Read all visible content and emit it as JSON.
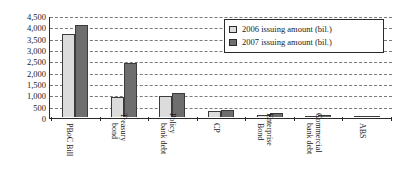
{
  "chart_data": {
    "type": "bar",
    "title": "",
    "xlabel": "",
    "ylabel": "",
    "ylim": [
      0,
      4500
    ],
    "ytick_step": 500,
    "grid": true,
    "legend_position": "top-right",
    "categories": [
      "PBoC Bill",
      "Treasury bond",
      "Policy bank debt",
      "CP",
      "Enterprise Bond",
      "Commercial bank debt",
      "ABS"
    ],
    "category_lines": [
      [
        "PBoC Bill"
      ],
      [
        "Treasury",
        "bond"
      ],
      [
        "Policy",
        "bank debt"
      ],
      [
        "CP"
      ],
      [
        "Enterprise",
        "Bond"
      ],
      [
        "Commercial",
        "bank debt"
      ],
      [
        "ABS"
      ]
    ],
    "ytick_labels": [
      "4,500",
      "4,000",
      "3,500",
      "3,000",
      "2,500",
      "2,000",
      "1,500",
      "1,000",
      "500",
      "0"
    ],
    "ytick_values": [
      4500,
      4000,
      3500,
      3000,
      2500,
      2000,
      1500,
      1000,
      500,
      0
    ],
    "series": [
      {
        "name": "2006 issuing amount (bil.)",
        "color": "#dcdcdc",
        "values": [
          3650,
          870,
          920,
          280,
          100,
          60,
          10
        ]
      },
      {
        "name": "2007 issuing amount (bil.)",
        "color": "#6e6e6e",
        "values": [
          4050,
          2370,
          1080,
          330,
          170,
          110,
          20
        ]
      }
    ]
  },
  "legend": {
    "items": [
      {
        "label": "2006 issuing amount (bil.)",
        "swatch": "light-gray-swatch"
      },
      {
        "label": "2007 issuing amount (bil.)",
        "swatch": "dark-gray-swatch"
      }
    ]
  },
  "colors": {
    "series_2006": "#dcdcdc",
    "series_2007": "#6e6e6e",
    "axis": "#2b2b2b",
    "gridline": "#7a7a7a",
    "background": "#ffffff",
    "text": "#1a1a1a"
  }
}
